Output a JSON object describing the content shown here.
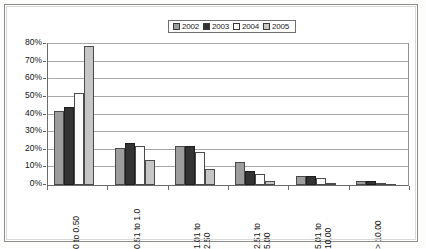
{
  "chart_data": {
    "type": "bar",
    "title": "",
    "xlabel": "",
    "ylabel": "",
    "categories": [
      "0 to 0.50",
      "0.51 to 1.0",
      "1.01 to\n2.50",
      "2.51 to\n5.00",
      "5.01 to\n10.00",
      "> 10.00"
    ],
    "series": [
      {
        "name": "2002",
        "color": "#9d9d9d",
        "values": [
          42,
          21,
          22,
          13,
          5,
          2
        ]
      },
      {
        "name": "2003",
        "color": "#333333",
        "values": [
          44,
          24,
          22,
          8,
          5,
          2
        ]
      },
      {
        "name": "2004",
        "color": "#fbfbfb",
        "values": [
          52,
          22,
          19,
          6,
          4,
          1
        ]
      },
      {
        "name": "2005",
        "color": "#c6c6c6",
        "values": [
          79,
          14,
          9,
          2,
          1,
          0
        ]
      }
    ],
    "ylim": [
      0,
      80
    ],
    "yticks": [
      "0%",
      "10%",
      "20%",
      "30%",
      "40%",
      "50%",
      "60%",
      "70%",
      "80%"
    ],
    "ytick_values": [
      0,
      10,
      20,
      30,
      40,
      50,
      60,
      70,
      80
    ],
    "grid": true,
    "legend_position": "top-center",
    "legend_entries": [
      "2002",
      "2003",
      "2004",
      "2005"
    ]
  }
}
